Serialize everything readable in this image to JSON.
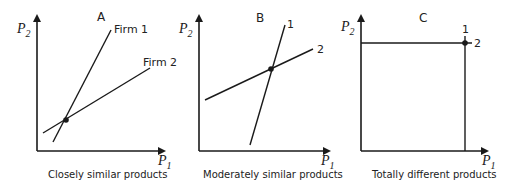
{
  "panels": [
    {
      "id": "A",
      "title": "A",
      "caption": "Closely similar products",
      "y_axis_label": "P",
      "y_axis_sub": "2",
      "x_axis_label": "P",
      "x_axis_sub": "1",
      "lines": [
        {
          "label": "Firm 1"
        },
        {
          "label": "Firm 2"
        }
      ]
    },
    {
      "id": "B",
      "title": "B",
      "caption": "Moderately similar products",
      "y_axis_label": "P",
      "y_axis_sub": "2",
      "x_axis_label": "P",
      "x_axis_sub": "1",
      "lines": [
        {
          "label": "1"
        },
        {
          "label": "2"
        }
      ]
    },
    {
      "id": "C",
      "title": "C",
      "caption": "Totally different products",
      "y_axis_label": "P",
      "y_axis_sub": "2",
      "x_axis_label": "P",
      "x_axis_sub": "1",
      "lines": [
        {
          "label": "1"
        },
        {
          "label": "2"
        }
      ]
    }
  ],
  "colors": {
    "line": "#1a1a1a",
    "background": "#ffffff"
  }
}
